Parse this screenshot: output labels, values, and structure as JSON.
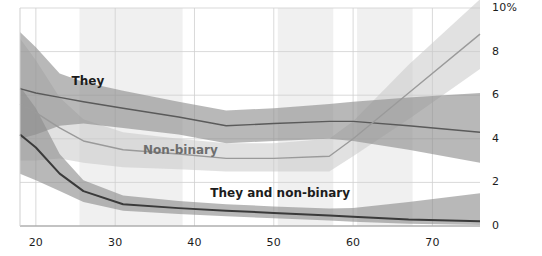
{
  "chart_data": {
    "type": "line",
    "title": "",
    "subtitle": "",
    "xlabel": "",
    "ylabel": "",
    "xlim": [
      18,
      76
    ],
    "ylim": [
      0,
      10
    ],
    "grid": true,
    "legend_position": "inline-annotations",
    "x_ticks": [
      "20",
      "30",
      "40",
      "50",
      "60",
      "70"
    ],
    "x_tick_values": [
      20,
      30,
      40,
      50,
      60,
      70
    ],
    "y_ticks": [
      "0",
      "2",
      "4",
      "6",
      "8",
      "10%"
    ],
    "y_tick_values": [
      0,
      2,
      4,
      6,
      8,
      10
    ],
    "x": [
      18,
      20,
      23,
      26,
      31,
      38,
      44,
      50,
      57,
      60,
      67,
      76
    ],
    "series": [
      {
        "name": "They",
        "label": "They",
        "color": "#5a5a5a",
        "band_color": "#8c8c8c",
        "values": [
          6.3,
          6.1,
          5.9,
          5.7,
          5.4,
          5.0,
          4.6,
          4.7,
          4.8,
          4.8,
          4.6,
          4.3
        ],
        "band_upper": [
          8.9,
          8.2,
          7.0,
          6.6,
          6.2,
          5.7,
          5.3,
          5.4,
          5.6,
          5.7,
          5.9,
          6.1
        ],
        "band_lower": [
          4.0,
          4.2,
          4.6,
          4.7,
          4.5,
          4.2,
          3.8,
          3.9,
          4.0,
          3.9,
          3.5,
          2.9
        ]
      },
      {
        "name": "Non-binary",
        "label": "Non-binary",
        "color": "#9a9a9a",
        "band_color": "#c9c9c9",
        "values": [
          5.6,
          5.2,
          4.5,
          3.9,
          3.5,
          3.3,
          3.1,
          3.1,
          3.2,
          4.0,
          6.1,
          8.8
        ],
        "band_upper": [
          8.6,
          7.6,
          5.9,
          4.9,
          4.3,
          4.0,
          3.8,
          3.8,
          4.0,
          4.8,
          7.4,
          10.4
        ],
        "band_lower": [
          3.0,
          3.0,
          3.1,
          2.9,
          2.7,
          2.6,
          2.5,
          2.5,
          2.5,
          3.2,
          4.9,
          7.2
        ]
      },
      {
        "name": "They and non-binary",
        "label": "They and non-binary",
        "color": "#3a3a3a",
        "band_color": "#8c8c8c",
        "values": [
          4.2,
          3.6,
          2.4,
          1.6,
          1.0,
          0.82,
          0.7,
          0.6,
          0.48,
          0.42,
          0.3,
          0.22
        ],
        "band_upper": [
          6.4,
          5.4,
          3.3,
          2.1,
          1.4,
          1.15,
          1.0,
          0.9,
          0.8,
          0.82,
          1.1,
          1.5
        ],
        "band_lower": [
          2.4,
          2.1,
          1.6,
          1.1,
          0.7,
          0.55,
          0.45,
          0.35,
          0.25,
          0.2,
          0.1,
          0.05
        ]
      }
    ],
    "shaded_bands": [
      {
        "x_start": 25.5,
        "x_end": 38.5
      },
      {
        "x_start": 50.5,
        "x_end": 57.5
      },
      {
        "x_start": 60.5,
        "x_end": 67.5
      }
    ],
    "annotations": [
      {
        "text": "They",
        "x": 24.5,
        "y": 6.6
      },
      {
        "text": "Non-binary",
        "x": 33.5,
        "y": 3.45
      },
      {
        "text": "They and non-binary",
        "x": 42.0,
        "y": 1.45
      }
    ]
  },
  "axis": {
    "y_unit_suffix": "%",
    "x_labels": [
      "20",
      "30",
      "40",
      "50",
      "60",
      "70"
    ],
    "y_labels": [
      "10%",
      "8",
      "6",
      "4",
      "2",
      "0"
    ]
  }
}
